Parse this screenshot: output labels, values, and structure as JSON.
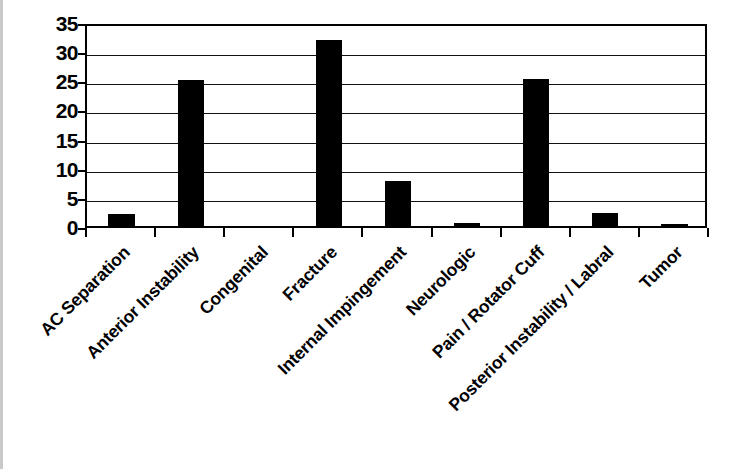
{
  "chart_data": {
    "type": "bar",
    "title": "",
    "subtitle": "",
    "xlabel": "",
    "ylabel": "",
    "ylim": [
      0,
      35
    ],
    "yticks": [
      0,
      5,
      10,
      15,
      20,
      25,
      30,
      35
    ],
    "ytick_labels": [
      "0",
      "5",
      "10",
      "15",
      "20",
      "25",
      "30",
      "35"
    ],
    "grid": "horizontal",
    "legend": "none",
    "bar_color": "#000000",
    "background_color": "#ffffff",
    "axis_color": "#000000",
    "categories": [
      "AC Separation",
      "Anterior Instability",
      "Congenital",
      "Fracture",
      "Internal Impingement",
      "Neurologic",
      "Pain / Rotator Cuff",
      "Posterior Instability / Labral",
      "Tumor"
    ],
    "values": [
      2,
      25,
      0,
      32,
      7.7,
      0.6,
      25.3,
      2.2,
      0.3
    ],
    "xtick_label_rotation": -45
  }
}
